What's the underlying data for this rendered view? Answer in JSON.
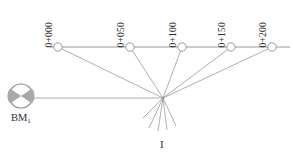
{
  "figure": {
    "width": 293,
    "height": 159,
    "background_color": "#ffffff",
    "line_color": "#9a9a9a",
    "text_color": "#2b2b2b",
    "symbol_fill_color": "#a8a8a8"
  },
  "chainage_line": {
    "name": "centre-line",
    "y": 47,
    "x_start": 50,
    "x_end": 290
  },
  "stations": [
    {
      "label": "0+000",
      "x": 58,
      "y": 47,
      "label_x": 54,
      "label_y": 38
    },
    {
      "label": "0+050",
      "x": 130,
      "y": 47,
      "label_x": 126,
      "label_y": 38
    },
    {
      "label": "0+100",
      "x": 182,
      "y": 47,
      "label_x": 178,
      "label_y": 38
    },
    {
      "label": "0+150",
      "x": 231,
      "y": 47,
      "label_x": 227,
      "label_y": 38
    },
    {
      "label": "0+200",
      "x": 272,
      "y": 47,
      "label_x": 268,
      "label_y": 38
    }
  ],
  "benchmark": {
    "label": "BM",
    "subscript": "1",
    "x": 21,
    "y": 96,
    "radius": 12
  },
  "instrument": {
    "label": "I",
    "x": 163,
    "y": 98
  }
}
